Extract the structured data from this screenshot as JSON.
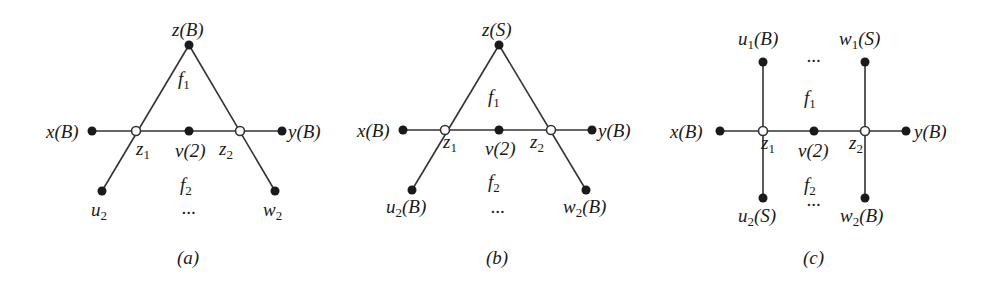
{
  "figure": {
    "panels": [
      {
        "id": "a",
        "caption": "(a)",
        "nodes": [
          {
            "id": "z",
            "label": "z(B)",
            "type": "filled"
          },
          {
            "id": "x",
            "label": "x(B)",
            "type": "filled"
          },
          {
            "id": "y",
            "label": "y(B)",
            "type": "filled"
          },
          {
            "id": "z1",
            "label": "z1",
            "type": "hollow"
          },
          {
            "id": "z2",
            "label": "z2",
            "type": "hollow"
          },
          {
            "id": "v",
            "label": "v(2)",
            "type": "filled"
          },
          {
            "id": "u2",
            "label": "u2",
            "type": "filled"
          },
          {
            "id": "w2",
            "label": "w2",
            "type": "filled"
          }
        ],
        "faces": [
          "f1",
          "f2"
        ],
        "ellipsis": [
          "..."
        ]
      },
      {
        "id": "b",
        "caption": "(b)",
        "nodes": [
          {
            "id": "z",
            "label": "z(S)",
            "type": "filled"
          },
          {
            "id": "x",
            "label": "x(B)",
            "type": "filled"
          },
          {
            "id": "y",
            "label": "y(B)",
            "type": "filled"
          },
          {
            "id": "z1",
            "label": "z1",
            "type": "hollow"
          },
          {
            "id": "z2",
            "label": "z2",
            "type": "hollow"
          },
          {
            "id": "v",
            "label": "v(2)",
            "type": "filled"
          },
          {
            "id": "u2",
            "label": "u2(B)",
            "type": "filled"
          },
          {
            "id": "w2",
            "label": "w2(B)",
            "type": "filled"
          }
        ],
        "faces": [
          "f1",
          "f2"
        ],
        "ellipsis": [
          "..."
        ]
      },
      {
        "id": "c",
        "caption": "(c)",
        "nodes": [
          {
            "id": "u1",
            "label": "u1(B)",
            "type": "filled"
          },
          {
            "id": "w1",
            "label": "w1(S)",
            "type": "filled"
          },
          {
            "id": "x",
            "label": "x(B)",
            "type": "filled"
          },
          {
            "id": "y",
            "label": "y(B)",
            "type": "filled"
          },
          {
            "id": "z1",
            "label": "z1",
            "type": "hollow"
          },
          {
            "id": "z2",
            "label": "z2",
            "type": "hollow"
          },
          {
            "id": "v",
            "label": "v(2)",
            "type": "filled"
          },
          {
            "id": "u2",
            "label": "u2(S)",
            "type": "filled"
          },
          {
            "id": "w2",
            "label": "w2(B)",
            "type": "filled"
          }
        ],
        "faces": [
          "f1",
          "f2"
        ],
        "ellipsis": [
          "...",
          "..."
        ]
      }
    ]
  }
}
